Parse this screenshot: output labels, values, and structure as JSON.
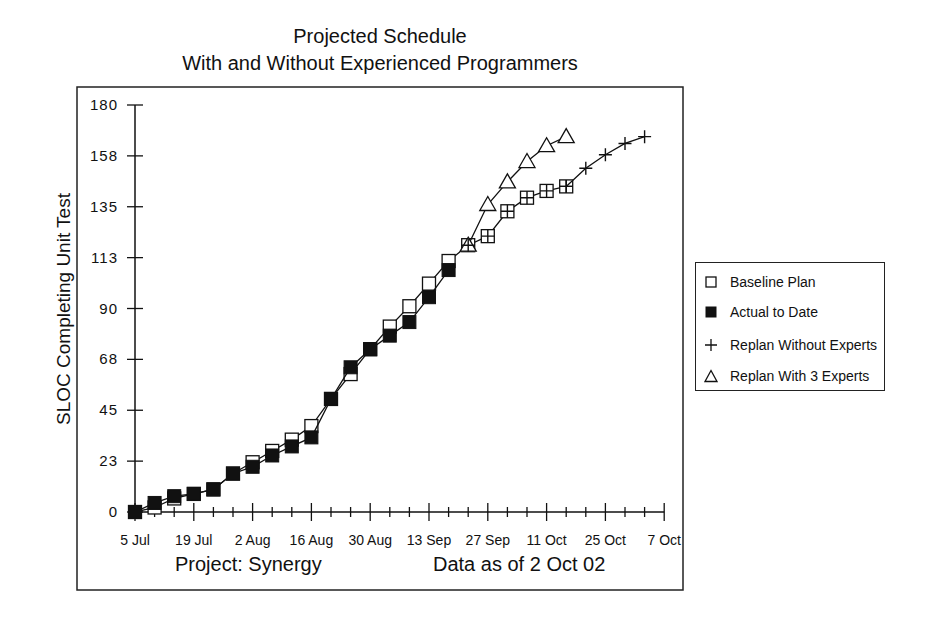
{
  "title": {
    "line1": "Projected Schedule",
    "line2": "With and Without Experienced Programmers"
  },
  "footer": {
    "project": "Project: Synergy",
    "data_as_of": "Data as of 2 Oct 02"
  },
  "legend": {
    "items": [
      {
        "label": "Baseline Plan",
        "marker": "hollow-square"
      },
      {
        "label": "Actual to Date",
        "marker": "filled-square"
      },
      {
        "label": "Replan Without Experts",
        "marker": "plus"
      },
      {
        "label": "Replan With 3 Experts",
        "marker": "hollow-triangle"
      }
    ]
  },
  "chart_data": {
    "type": "line",
    "xlabel": "",
    "ylabel": "SLOC Completing Unit Test",
    "x_tick_labels": [
      "5 Jul",
      "19 Jul",
      "2 Aug",
      "16 Aug",
      "30 Aug",
      "13 Sep",
      "27 Sep",
      "11 Oct",
      "25 Oct",
      "7 Oct"
    ],
    "y_tick_labels": [
      "0",
      "23",
      "45",
      "68",
      "90",
      "113",
      "135",
      "158",
      "180"
    ],
    "ylim": [
      0,
      180
    ],
    "x_point_spacing": "3 points per 2-week major interval (index 0 = 5 Jul)",
    "grid": false,
    "legend_position": "right",
    "series": [
      {
        "name": "Baseline Plan",
        "marker": "hollow-square",
        "x": [
          0,
          1,
          2,
          3,
          4,
          5,
          6,
          7,
          8,
          9,
          10,
          11,
          12,
          13,
          14,
          15,
          16,
          17,
          18,
          19,
          20,
          21,
          22
        ],
        "values": [
          0,
          2,
          6,
          8,
          10,
          17,
          22,
          27,
          32,
          38,
          50,
          61,
          72,
          82,
          91,
          101,
          111,
          118,
          122,
          133,
          139,
          142,
          144
        ]
      },
      {
        "name": "Actual to Date",
        "marker": "filled-square",
        "x": [
          0,
          1,
          2,
          3,
          4,
          5,
          6,
          7,
          8,
          9,
          10,
          11,
          12,
          13,
          14,
          15,
          16
        ],
        "values": [
          0,
          4,
          7,
          8,
          10,
          17,
          20,
          25,
          29,
          33,
          50,
          64,
          72,
          78,
          84,
          95,
          107
        ]
      },
      {
        "name": "Replan Without Experts",
        "marker": "plus",
        "x": [
          22,
          23,
          24,
          25,
          26
        ],
        "values": [
          144,
          152,
          158,
          163,
          166
        ]
      },
      {
        "name": "Replan With 3 Experts",
        "marker": "hollow-triangle",
        "x": [
          17,
          18,
          19,
          20,
          21,
          22
        ],
        "values": [
          118,
          136,
          146,
          155,
          162,
          166
        ]
      }
    ]
  }
}
